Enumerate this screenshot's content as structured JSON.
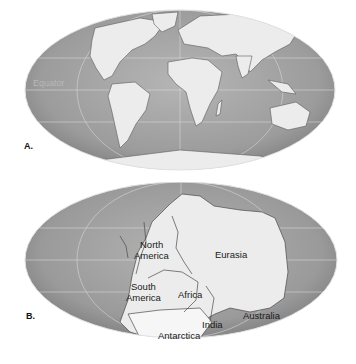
{
  "figure": {
    "panels": [
      {
        "id": "A",
        "label": "A.",
        "description": "Present-day continents",
        "annotations": {
          "equator": "Equator"
        }
      },
      {
        "id": "B",
        "label": "B.",
        "description": "Supercontinent Pangaea",
        "continents": {
          "north_america_line1": "North",
          "north_america_line2": "America",
          "eurasia": "Eurasia",
          "south_america_line1": "South",
          "south_america_line2": "America",
          "africa": "Africa",
          "australia": "Australia",
          "india": "India",
          "antarctica": "Antarctica"
        }
      }
    ],
    "colors": {
      "ocean": "#9a9a9a",
      "ocean_light": "#b9b9b9",
      "land": "#ececec",
      "gridline": "#d4d4d4",
      "background": "#ffffff"
    }
  }
}
